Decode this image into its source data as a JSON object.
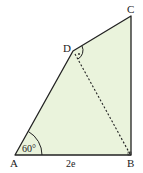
{
  "diagram": {
    "type": "geometry-quadrilateral",
    "fill_color": "#eaf3dc",
    "stroke_color": "#222222",
    "points": {
      "A": {
        "label": "A",
        "x": 15,
        "y": 155
      },
      "B": {
        "label": "B",
        "x": 131,
        "y": 155
      },
      "C": {
        "label": "C",
        "x": 131,
        "y": 16
      },
      "D": {
        "label": "D",
        "x": 73,
        "y": 51
      }
    },
    "angle_A": "60°",
    "side_AB": "2e",
    "diagonal": "DB (dashed)",
    "angle_D_marked": "right angle (dot)"
  }
}
